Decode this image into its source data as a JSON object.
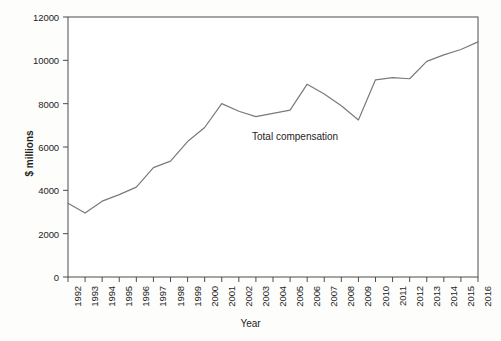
{
  "figure": {
    "background_color": "#fdfdfc",
    "plot_border_color": "#4d4d4d",
    "line_color": "#7a7a7a"
  },
  "axes": {
    "y_axis_title": "$ millions",
    "x_axis_title": "Year",
    "y_ticks": [
      "0",
      "2000",
      "4000",
      "6000",
      "8000",
      "10000",
      "12000"
    ],
    "x_ticks": [
      "1992",
      "1993",
      "1994",
      "1995",
      "1996",
      "1997",
      "1998",
      "1999",
      "2000",
      "2001",
      "2002",
      "2003",
      "2004",
      "2005",
      "2006",
      "2007",
      "2008",
      "2009",
      "2010",
      "2011",
      "2012",
      "2013",
      "2014",
      "2015",
      "2016"
    ]
  },
  "annotations": {
    "series_label": "Total compensation"
  },
  "chart_data": {
    "type": "line",
    "title": "",
    "xlabel": "Year",
    "ylabel": "$ millions",
    "ylim": [
      0,
      12000
    ],
    "xlim": [
      "1992",
      "2016"
    ],
    "grid": false,
    "legend": "inline-annotation",
    "categories": [
      "1992",
      "1993",
      "1994",
      "1995",
      "1996",
      "1997",
      "1998",
      "1999",
      "2000",
      "2001",
      "2002",
      "2003",
      "2004",
      "2005",
      "2006",
      "2007",
      "2008",
      "2009",
      "2010",
      "2011",
      "2012",
      "2013",
      "2014",
      "2015",
      "2016"
    ],
    "series": [
      {
        "name": "Total compensation",
        "values": [
          3400,
          2950,
          3500,
          3800,
          4150,
          5050,
          5350,
          6250,
          6900,
          8000,
          7650,
          7400,
          7550,
          7700,
          8900,
          8450,
          7900,
          7250,
          9100,
          9200,
          9150,
          9950,
          10250,
          10500,
          10850
        ]
      }
    ]
  }
}
